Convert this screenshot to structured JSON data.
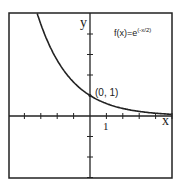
{
  "chart_data": {
    "type": "line",
    "function": "f(x)=e^(-x/2)",
    "xlabel": "x",
    "ylabel": "y",
    "xlim": [
      -5,
      5
    ],
    "ylim": [
      -3,
      5
    ],
    "grid": false,
    "tick_label": "1",
    "annotation": {
      "text": "(0, 1)",
      "x": 0,
      "y": 1
    },
    "series": [
      {
        "name": "f(x)=e^(-x/2)",
        "x": [
          -3.2,
          -3,
          -2.5,
          -2,
          -1.5,
          -1,
          -0.5,
          0,
          0.5,
          1,
          1.5,
          2,
          2.5,
          3,
          3.5,
          4,
          4.5,
          5
        ],
        "y": [
          4.95,
          4.48,
          3.49,
          2.72,
          2.12,
          1.65,
          1.28,
          1.0,
          0.78,
          0.61,
          0.47,
          0.37,
          0.29,
          0.22,
          0.17,
          0.14,
          0.11,
          0.08
        ]
      }
    ]
  },
  "labels": {
    "title": "f(x)=e",
    "exponent": "(-x/2)",
    "x_axis": "x",
    "y_axis": "y",
    "tick_one": "1",
    "point": "(0, 1)"
  }
}
